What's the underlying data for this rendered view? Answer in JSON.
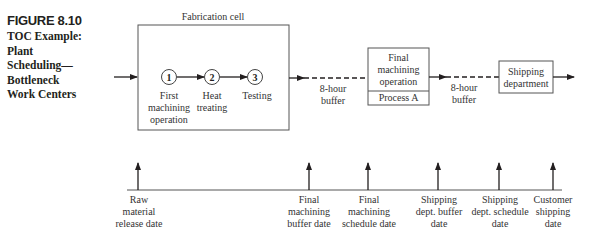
{
  "figure": {
    "number": "FIGURE 8.10",
    "title": "TOC Example:\nPlant\nScheduling—\nBottleneck\nWork Centers"
  },
  "flow": {
    "fabrication_cell": {
      "label": "Fabrication cell",
      "steps": [
        {
          "num": "1",
          "label_lines": [
            "First",
            "machining",
            "operation"
          ]
        },
        {
          "num": "2",
          "label_lines": [
            "Heat",
            "treating"
          ]
        },
        {
          "num": "3",
          "label_lines": [
            "Testing"
          ]
        }
      ]
    },
    "buffer1": {
      "lines": [
        "8-hour",
        "buffer"
      ]
    },
    "final_machining": {
      "lines": [
        "Final",
        "machining",
        "operation"
      ],
      "sub": "Process A"
    },
    "buffer2": {
      "lines": [
        "8-hour",
        "buffer"
      ]
    },
    "shipping": {
      "lines": [
        "Shipping",
        "department"
      ]
    }
  },
  "timeline": {
    "markers": [
      {
        "lines": [
          "Raw",
          "material",
          "release date"
        ]
      },
      {
        "lines": [
          "Final",
          "machining",
          "buffer date"
        ]
      },
      {
        "lines": [
          "Final",
          "machining",
          "schedule date"
        ]
      },
      {
        "lines": [
          "Shipping",
          "dept. buffer",
          "date"
        ]
      },
      {
        "lines": [
          "Shipping",
          "dept. schedule",
          "date"
        ]
      },
      {
        "lines": [
          "Customer",
          "shipping",
          "date"
        ]
      }
    ]
  }
}
